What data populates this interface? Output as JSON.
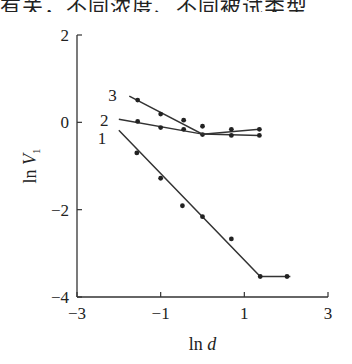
{
  "header": {
    "cropped_text": "有关，不同浓度、不同被试类型"
  },
  "chart_data": {
    "type": "line",
    "title": "",
    "xlabel": "ln d",
    "ylabel": "ln V1",
    "xlim": [
      -3,
      3
    ],
    "ylim": [
      -4,
      2
    ],
    "xticks": [
      -3,
      -1,
      1,
      3
    ],
    "yticks": [
      2,
      0,
      -2,
      -4
    ],
    "xtick_labels": [
      "−3",
      "−1",
      "1",
      "3"
    ],
    "ytick_labels": [
      "2",
      "0",
      "−2",
      "−4"
    ],
    "grid": false,
    "legend": "inline labels at left end of lines",
    "series": [
      {
        "name": "1",
        "points": [
          [
            -1.57,
            -0.7
          ],
          [
            -1.0,
            -1.28
          ],
          [
            -0.48,
            -1.91
          ],
          [
            0.0,
            -2.16
          ],
          [
            0.69,
            -2.67
          ],
          [
            1.38,
            -3.53
          ],
          [
            2.02,
            -3.53
          ]
        ],
        "fit_line": [
          [
            -2.0,
            -0.18
          ],
          [
            1.38,
            -3.53
          ],
          [
            2.1,
            -3.53
          ]
        ]
      },
      {
        "name": "2",
        "points": [
          [
            -1.55,
            0.02
          ],
          [
            -1.0,
            -0.12
          ],
          [
            -0.45,
            -0.16
          ],
          [
            0.0,
            -0.28
          ],
          [
            0.69,
            -0.3
          ],
          [
            1.36,
            -0.3
          ]
        ],
        "fit_line": [
          [
            -2.0,
            0.07
          ],
          [
            0.0,
            -0.27
          ],
          [
            1.36,
            -0.3
          ]
        ]
      },
      {
        "name": "3",
        "points": [
          [
            -1.55,
            0.51
          ],
          [
            -1.0,
            0.19
          ],
          [
            -0.45,
            0.05
          ],
          [
            0.0,
            -0.09
          ],
          [
            0.69,
            -0.16
          ],
          [
            1.36,
            -0.16
          ]
        ],
        "fit_line": [
          [
            -1.75,
            0.6
          ],
          [
            0.0,
            -0.27
          ],
          [
            1.36,
            -0.16
          ]
        ]
      }
    ]
  }
}
